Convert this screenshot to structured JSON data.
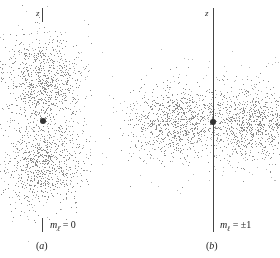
{
  "figure": {
    "panels": [
      {
        "id": "a",
        "axis_label": "z",
        "m_symbol": "m",
        "m_subscript": "ℓ",
        "m_value": "= 0",
        "caption_open": "(",
        "caption_letter": "a",
        "caption_close": ")",
        "shape": "dumbbell along z"
      },
      {
        "id": "b",
        "axis_label": "z",
        "m_symbol": "m",
        "m_subscript": "ℓ",
        "m_value": "= ±1",
        "caption_open": "(",
        "caption_letter": "b",
        "caption_close": ")",
        "shape": "torus around z"
      }
    ],
    "colors": {
      "dots": "#8a8a8a",
      "axis": "#444444",
      "nucleus": "#333333"
    }
  }
}
